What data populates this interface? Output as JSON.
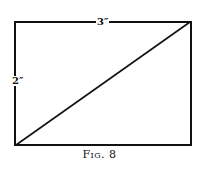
{
  "figure": {
    "caption": "Fig. 8",
    "caption_prefix": "Fig.",
    "caption_number": "8",
    "shape": "rectangle-with-diagonal",
    "rectangle": {
      "width_label": "3″",
      "height_label": "2″"
    },
    "diagonal": "from bottom-left corner to top-right corner",
    "colors": {
      "stroke": "#111111",
      "background": "#ffffff"
    }
  }
}
